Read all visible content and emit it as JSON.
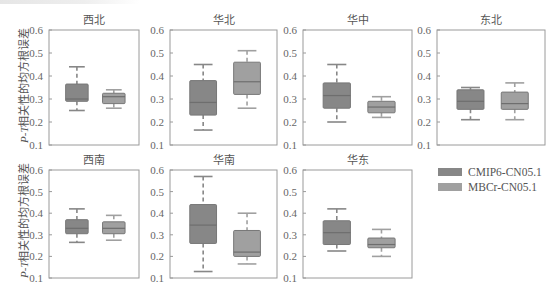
{
  "chart_data": {
    "type": "box",
    "title": "",
    "ylabel": "P-T相关性的均方根误差",
    "ylim": [
      0.1,
      0.6
    ],
    "yticks": [
      0.1,
      0.2,
      0.3,
      0.4,
      0.5,
      0.6
    ],
    "legend": {
      "position": "right-middle",
      "entries": [
        {
          "name": "CMIP6-CN05.1",
          "color": "#878787"
        },
        {
          "name": "MBCr-CN05.1",
          "color": "#a0a0a0"
        }
      ]
    },
    "panels": [
      {
        "title": "西北",
        "series": [
          {
            "name": "CMIP6-CN05.1",
            "min": 0.25,
            "q1": 0.29,
            "median": 0.3,
            "q3": 0.365,
            "max": 0.44
          },
          {
            "name": "MBCr-CN05.1",
            "min": 0.26,
            "q1": 0.28,
            "median": 0.31,
            "q3": 0.325,
            "max": 0.34
          }
        ]
      },
      {
        "title": "华北",
        "series": [
          {
            "name": "CMIP6-CN05.1",
            "min": 0.165,
            "q1": 0.23,
            "median": 0.285,
            "q3": 0.38,
            "max": 0.45
          },
          {
            "name": "MBCr-CN05.1",
            "min": 0.26,
            "q1": 0.32,
            "median": 0.375,
            "q3": 0.46,
            "max": 0.51
          }
        ]
      },
      {
        "title": "华中",
        "series": [
          {
            "name": "CMIP6-CN05.1",
            "min": 0.2,
            "q1": 0.26,
            "median": 0.315,
            "q3": 0.37,
            "max": 0.45
          },
          {
            "name": "MBCr-CN05.1",
            "min": 0.22,
            "q1": 0.24,
            "median": 0.265,
            "q3": 0.29,
            "max": 0.31
          }
        ]
      },
      {
        "title": "东北",
        "series": [
          {
            "name": "CMIP6-CN05.1",
            "min": 0.21,
            "q1": 0.255,
            "median": 0.29,
            "q3": 0.34,
            "max": 0.35
          },
          {
            "name": "MBCr-CN05.1",
            "min": 0.21,
            "q1": 0.255,
            "median": 0.28,
            "q3": 0.33,
            "max": 0.37
          }
        ]
      },
      {
        "title": "西南",
        "series": [
          {
            "name": "CMIP6-CN05.1",
            "min": 0.265,
            "q1": 0.305,
            "median": 0.33,
            "q3": 0.37,
            "max": 0.42
          },
          {
            "name": "MBCr-CN05.1",
            "min": 0.275,
            "q1": 0.305,
            "median": 0.33,
            "q3": 0.36,
            "max": 0.39
          }
        ]
      },
      {
        "title": "华南",
        "series": [
          {
            "name": "CMIP6-CN05.1",
            "min": 0.13,
            "q1": 0.26,
            "median": 0.345,
            "q3": 0.44,
            "max": 0.57
          },
          {
            "name": "MBCr-CN05.1",
            "min": 0.165,
            "q1": 0.2,
            "median": 0.22,
            "q3": 0.32,
            "max": 0.4
          }
        ]
      },
      {
        "title": "华东",
        "series": [
          {
            "name": "CMIP6-CN05.1",
            "min": 0.225,
            "q1": 0.255,
            "median": 0.31,
            "q3": 0.365,
            "max": 0.42
          },
          {
            "name": "MBCr-CN05.1",
            "min": 0.2,
            "q1": 0.24,
            "median": 0.255,
            "q3": 0.285,
            "max": 0.325
          }
        ]
      }
    ]
  },
  "labels": {
    "ylabel_italic": "P-T",
    "ylabel_rest": "相关性的均方根误差"
  }
}
